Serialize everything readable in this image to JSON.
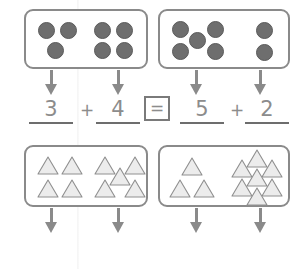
{
  "worksheet": {
    "title": "Compare number groups worksheet",
    "rows": [
      {
        "id": "row-dots",
        "shape": "circle",
        "left_box": {
          "groups": [
            {
              "count": 3,
              "layout": "three-corner"
            },
            {
              "count": 4,
              "layout": "two-by-two"
            }
          ]
        },
        "right_box": {
          "groups": [
            {
              "count": 5,
              "layout": "quincunx"
            },
            {
              "count": 2,
              "layout": "vertical-pair"
            }
          ]
        },
        "equation": {
          "left_term_1": "3",
          "operator_1": "+",
          "left_term_2": "4",
          "comparison": "=",
          "right_term_1": "5",
          "operator_2": "+",
          "right_term_2": "2"
        }
      },
      {
        "id": "row-triangles",
        "shape": "triangle",
        "left_box": {
          "groups": [
            {
              "count": 4,
              "layout": "two-by-two"
            },
            {
              "count": 5,
              "layout": "quincunx"
            }
          ]
        },
        "right_box": {
          "groups": [
            {
              "count": 3,
              "layout": "one-over-two"
            },
            {
              "count": 7,
              "layout": "diamond-cluster"
            }
          ]
        },
        "equation": {
          "left_term_1": "4",
          "operator_1": "+",
          "left_term_2": "5",
          "comparison": "X",
          "right_term_1": "3",
          "operator_2": "+",
          "right_term_2": "7"
        }
      }
    ],
    "colors": {
      "box_border": "#8a8a8a",
      "dot_fill": "#6e6e6e",
      "triangle_fill": "#ececec",
      "triangle_stroke": "#8f8f8f",
      "arrow": "#8a8a8a",
      "pencil_text": "#8c8c8c",
      "underline": "#6d6d6d",
      "paper": "#ffffff"
    }
  }
}
